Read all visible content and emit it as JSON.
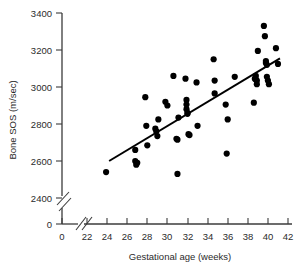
{
  "chart_data": {
    "type": "scatter",
    "title": "",
    "xlabel": "Gestational age (weeks)",
    "ylabel": "Bone SOS (m/sec)",
    "xlim": [
      22,
      42
    ],
    "ylim": [
      2400,
      3400
    ],
    "xticks": [
      "0",
      "22",
      "24",
      "26",
      "28",
      "30",
      "32",
      "34",
      "36",
      "38",
      "40",
      "42"
    ],
    "yticks": [
      "0",
      "2400",
      "2600",
      "2800",
      "3000",
      "3200",
      "3400"
    ],
    "x_axis_break": true,
    "y_axis_break": true,
    "grid": false,
    "legend": null,
    "marker": "filled-circle",
    "marker_color": "#000000",
    "series": [
      {
        "name": "Bone SOS measurements",
        "x": [
          23.9,
          26.8,
          26.8,
          26.9,
          27.0,
          27.8,
          27.9,
          28.0,
          28.8,
          28.9,
          29.0,
          29.1,
          29.8,
          30.0,
          30.6,
          30.9,
          31.0,
          31.0,
          31.1,
          31.8,
          31.9,
          31.9,
          31.9,
          32.0,
          32.0,
          32.1,
          32.2,
          32.9,
          33.0,
          34.6,
          34.7,
          34.7,
          35.8,
          35.9,
          36.0,
          36.7,
          38.6,
          38.7,
          38.8,
          38.8,
          38.9,
          38.9,
          39.0,
          39.6,
          39.7,
          39.8,
          39.8,
          39.9,
          39.9,
          40.0,
          40.1,
          40.8,
          41.0
        ],
        "y": [
          2540,
          2660,
          2600,
          2580,
          2590,
          2945,
          2790,
          2685,
          2775,
          2760,
          2735,
          2825,
          2920,
          2900,
          3060,
          2720,
          2715,
          2530,
          2835,
          3045,
          2930,
          2905,
          2880,
          2860,
          2855,
          2745,
          2740,
          3025,
          2790,
          3150,
          3035,
          2965,
          2905,
          2640,
          2825,
          3055,
          2915,
          3045,
          3060,
          3040,
          3035,
          3015,
          3195,
          3330,
          3275,
          3140,
          3130,
          3120,
          3055,
          3035,
          3015,
          3210,
          3125
        ]
      }
    ],
    "fit_line": {
      "name": "regression line",
      "x_start": 24.2,
      "y_start": 2600,
      "x_end": 41.2,
      "y_end": 3155
    }
  },
  "axes": {
    "y_label": "Bone SOS (m/sec)",
    "x_label": "Gestational age (weeks)",
    "y_tick_labels": [
      "3400",
      "3200",
      "3000",
      "2800",
      "2600",
      "2400",
      "0"
    ],
    "x_tick_labels": [
      "0",
      "22",
      "24",
      "26",
      "28",
      "30",
      "32",
      "34",
      "36",
      "38",
      "40",
      "42"
    ]
  }
}
